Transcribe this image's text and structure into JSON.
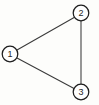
{
  "diagram": {
    "type": "undirected-graph",
    "title": "",
    "canvas": {
      "width": 99,
      "height": 105,
      "background": "#fdfdfb"
    },
    "style": {
      "node_fill": "#fefefe",
      "node_stroke": "#1d1d1d",
      "edge_stroke": "#3a3a3a",
      "label_color": "#262626"
    },
    "nodes": [
      {
        "id": "1",
        "label": "1",
        "cx": 10,
        "cy": 54,
        "r": 7.8
      },
      {
        "id": "2",
        "label": "2",
        "cx": 81,
        "cy": 13,
        "r": 7.8
      },
      {
        "id": "3",
        "label": "3",
        "cx": 81,
        "cy": 92,
        "r": 7.8
      }
    ],
    "edges": [
      {
        "id": "e12",
        "from": "1",
        "to": "2",
        "x1": 17,
        "y1": 50,
        "x2": 75,
        "y2": 17
      },
      {
        "id": "e13",
        "from": "1",
        "to": "3",
        "x1": 17,
        "y1": 58,
        "x2": 75,
        "y2": 89
      },
      {
        "id": "e23",
        "from": "2",
        "to": "3",
        "x1": 81,
        "y1": 21,
        "x2": 81,
        "y2": 84
      }
    ]
  }
}
